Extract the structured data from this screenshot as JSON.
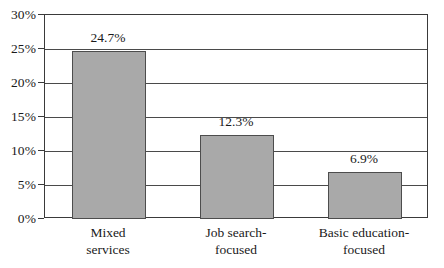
{
  "chart_data": {
    "type": "bar",
    "title": "",
    "subtitle": "",
    "xlabel": "",
    "ylabel": "",
    "categories": [
      "Mixed services",
      "Job search-focused",
      "Basic education-focused"
    ],
    "category_lines": [
      [
        "Mixed",
        "services"
      ],
      [
        "Job search-",
        "focused"
      ],
      [
        "Basic education-",
        "focused"
      ]
    ],
    "values": [
      24.7,
      12.3,
      6.9
    ],
    "data_labels": [
      "24.7%",
      "12.3%",
      "6.9%"
    ],
    "ylim": [
      0,
      30
    ],
    "ytick_values": [
      0,
      5,
      10,
      15,
      20,
      25,
      30
    ],
    "ytick_labels": [
      "0%",
      "5%",
      "10%",
      "15%",
      "20%",
      "25%",
      "30%"
    ],
    "grid": true,
    "legend": null,
    "legend_position": "none",
    "bar_color": "#a9a9a9",
    "bar_border_color": "#4d4d4d",
    "axis_color": "#3a3a3a",
    "grid_color": "#4a4a4a",
    "background_color": "#ffffff",
    "text_color": "#1a1a1a"
  }
}
